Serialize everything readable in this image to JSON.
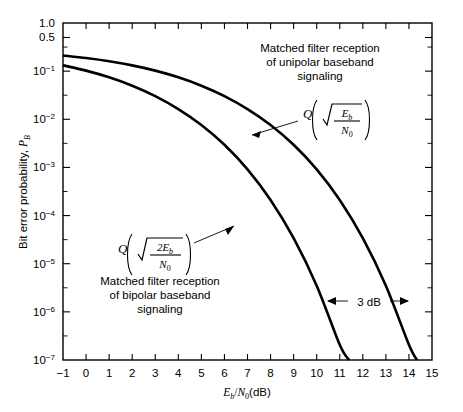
{
  "chart_data": {
    "type": "line",
    "title": "",
    "xlabel": "Eb/N0 (dB)",
    "ylabel": "Bit error probability, PB",
    "xlim": [
      -1,
      15
    ],
    "ylim_log": [
      1e-07,
      1.0
    ],
    "grid": false,
    "legend_position": "inline-annotations",
    "x_ticks": [
      "-1",
      "0",
      "1",
      "2",
      "3",
      "4",
      "5",
      "6",
      "7",
      "8",
      "9",
      "10",
      "11",
      "12",
      "13",
      "14",
      "15"
    ],
    "y_ticks": [
      "1.0",
      "0.5",
      "10-1",
      "10-2",
      "10-3",
      "10-4",
      "10-5",
      "10-6",
      "10-7"
    ],
    "y_tick_display": [
      {
        "mantissa": "1.0",
        "exp": null
      },
      {
        "mantissa": "0.5",
        "exp": null
      },
      {
        "mantissa": "10",
        "exp": "-1"
      },
      {
        "mantissa": "10",
        "exp": "-2"
      },
      {
        "mantissa": "10",
        "exp": "-3"
      },
      {
        "mantissa": "10",
        "exp": "-4"
      },
      {
        "mantissa": "10",
        "exp": "-5"
      },
      {
        "mantissa": "10",
        "exp": "-6"
      },
      {
        "mantissa": "10",
        "exp": "-7"
      }
    ],
    "series": [
      {
        "name": "Q(sqrt(Eb/N0)) unipolar baseband",
        "x": [
          -1,
          0,
          1,
          2,
          3,
          4,
          5,
          6,
          7,
          8,
          9,
          10,
          11,
          12,
          13,
          14,
          14.35
        ],
        "y": [
          0.2113,
          0.187,
          0.1605,
          0.1318,
          0.1025,
          0.0744,
          0.0498,
          0.0303,
          0.0163,
          0.00759,
          0.00295,
          0.000912,
          0.000211,
          3.39e-05,
          3.5e-06,
          2.07e-07,
          1e-07
        ]
      },
      {
        "name": "Q(sqrt(2Eb/N0)) bipolar baseband",
        "x": [
          -1,
          0,
          1,
          2,
          3,
          4,
          5,
          6,
          7,
          8,
          9,
          10,
          11,
          11.4
        ],
        "y": [
          0.1318,
          0.1025,
          0.0744,
          0.0498,
          0.0303,
          0.0163,
          0.00759,
          0.00295,
          0.000912,
          0.000211,
          3.39e-05,
          3.5e-06,
          2.07e-07,
          1e-07
        ]
      }
    ],
    "annotations": [
      {
        "id": "unipolar-caption",
        "text_lines": [
          "Matched filter reception",
          "of unipolar baseband",
          "signaling"
        ]
      },
      {
        "id": "unipolar-formula",
        "text": "Q( sqrt( Eb / N0 ) )"
      },
      {
        "id": "bipolar-formula",
        "text": "Q( sqrt( 2Eb / N0 ) )"
      },
      {
        "id": "bipolar-caption",
        "text_lines": [
          "Matched filter reception",
          "of bipolar baseband",
          "signaling"
        ]
      },
      {
        "id": "gap-label",
        "text": "3 dB"
      }
    ]
  },
  "axes": {
    "y_label_parts": {
      "text": "Bit error probability, ",
      "sym": "P",
      "sub": "B"
    },
    "x_label_parts": {
      "e": "E",
      "e_sub": "b",
      "slash": "/",
      "n": "N",
      "n_sub": "0",
      "unit": "(dB)"
    }
  },
  "annotations": {
    "unipolar": {
      "line1": "Matched filter reception",
      "line2": "of unipolar baseband",
      "line3": "signaling"
    },
    "bipolar": {
      "line1": "Matched filter reception",
      "line2": "of bipolar baseband",
      "line3": "signaling"
    },
    "formula_unipolar": {
      "q": "Q",
      "num": "E",
      "num_sub": "b",
      "den": "N",
      "den_sub": "0"
    },
    "formula_bipolar": {
      "q": "Q",
      "num": "2E",
      "num_sub": "b",
      "den": "N",
      "den_sub": "0"
    },
    "gap": {
      "label": "3 dB"
    }
  },
  "colors": {
    "curve": "#000000",
    "axis": "#000000",
    "background": "#ffffff"
  }
}
